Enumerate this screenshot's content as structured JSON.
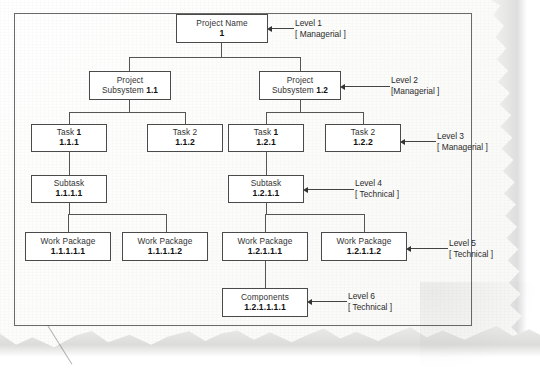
{
  "document": {
    "type": "work-breakdown-structure",
    "title": "Work Breakdown Structure Diagram",
    "medium": "scanned paper with torn right and bottom edges"
  },
  "nodes": [
    {
      "id": "n1",
      "title": "Project Name",
      "title_bold": "",
      "code": "1",
      "level": 1,
      "x": 176,
      "y": 14,
      "w": 92,
      "h": 29
    },
    {
      "id": "n2",
      "title": "Project",
      "title_bold": "",
      "code": "",
      "level": 2,
      "x": 89,
      "y": 71,
      "w": 82,
      "h": 29
    },
    {
      "id": "n3",
      "title": "Project",
      "title_bold": "",
      "code": "",
      "level": 2,
      "x": 259,
      "y": 71,
      "w": 82,
      "h": 29
    },
    {
      "id": "n4",
      "title": "Task 1",
      "title_bold": "1",
      "code": "1.1.1",
      "level": 3,
      "x": 31,
      "y": 124,
      "w": 76,
      "h": 28
    },
    {
      "id": "n5",
      "title": "Task 2",
      "title_bold": "",
      "code": "1.1.2",
      "level": 3,
      "x": 147,
      "y": 124,
      "w": 76,
      "h": 28
    },
    {
      "id": "n6",
      "title": "Task 1",
      "title_bold": "1",
      "code": "1.2.1",
      "level": 3,
      "x": 228,
      "y": 124,
      "w": 76,
      "h": 28
    },
    {
      "id": "n7",
      "title": "Task 2",
      "title_bold": "",
      "code": "1.2.2",
      "level": 3,
      "x": 325,
      "y": 124,
      "w": 76,
      "h": 28
    },
    {
      "id": "n8",
      "title": "Subtask",
      "title_bold": "",
      "code": "1.1.1.1",
      "level": 4,
      "x": 31,
      "y": 175,
      "w": 76,
      "h": 28
    },
    {
      "id": "n9",
      "title": "Subtask",
      "title_bold": "",
      "code": "1.2.1.1",
      "level": 4,
      "x": 228,
      "y": 175,
      "w": 76,
      "h": 28
    },
    {
      "id": "n10",
      "title": "Work Package",
      "title_bold": "",
      "code": "1.1.1.1.1",
      "level": 5,
      "x": 25,
      "y": 232,
      "w": 86,
      "h": 29
    },
    {
      "id": "n11",
      "title": "Work Package",
      "title_bold": "",
      "code": "1.1.1.1.2",
      "level": 5,
      "x": 122,
      "y": 232,
      "w": 86,
      "h": 29
    },
    {
      "id": "n12",
      "title": "Work Package",
      "title_bold": "",
      "code": "1.2.1.1.1",
      "level": 5,
      "x": 222,
      "y": 232,
      "w": 86,
      "h": 29
    },
    {
      "id": "n13",
      "title": "Work Package",
      "title_bold": "",
      "code": "1.2.1.1.2",
      "level": 5,
      "x": 321,
      "y": 232,
      "w": 86,
      "h": 29
    },
    {
      "id": "n14",
      "title": "Components",
      "title_bold": "",
      "code": "1.2.1.1.1.1",
      "level": 6,
      "x": 222,
      "y": 288,
      "w": 86,
      "h": 29
    }
  ],
  "subsystem_labels": [
    {
      "id": "n2",
      "prefix": "Subsystem ",
      "code": "1.1"
    },
    {
      "id": "n3",
      "prefix": "Subsystem ",
      "code": "1.2"
    }
  ],
  "annotations": [
    {
      "id": "a1",
      "level": "Level 1",
      "kind": "[ Managerial ]",
      "text_x": 295,
      "text_y": 18,
      "arrow_x": 272,
      "arrow_y": 28,
      "arrow_w": 22
    },
    {
      "id": "a2",
      "level": "Level 2",
      "kind": "[Managerial ]",
      "text_x": 391,
      "text_y": 75,
      "arrow_x": 345,
      "arrow_y": 86,
      "arrow_w": 45
    },
    {
      "id": "a3",
      "level": "Level 3",
      "kind": "[ Managerial ]",
      "text_x": 437,
      "text_y": 131,
      "arrow_x": 405,
      "arrow_y": 141,
      "arrow_w": 31
    },
    {
      "id": "a4",
      "level": "Level 4",
      "kind": "[ Technical ]",
      "text_x": 355,
      "text_y": 178,
      "arrow_x": 308,
      "arrow_y": 189,
      "arrow_w": 46
    },
    {
      "id": "a5",
      "level": "Level 5",
      "kind": "[ Technical ]",
      "text_x": 449,
      "text_y": 238,
      "arrow_x": 411,
      "arrow_y": 248,
      "arrow_w": 37
    },
    {
      "id": "a6",
      "level": "Level 6",
      "kind": "[ Technical ]",
      "text_x": 348,
      "text_y": 291,
      "arrow_x": 312,
      "arrow_y": 301,
      "arrow_w": 35
    }
  ],
  "connectors": {
    "description": "orthogonal parent-child lines",
    "segments": [
      {
        "o": "v",
        "x": 221,
        "y": 43,
        "len": 14
      },
      {
        "o": "h",
        "x": 129,
        "y": 57,
        "len": 172
      },
      {
        "o": "v",
        "x": 129,
        "y": 57,
        "len": 14
      },
      {
        "o": "v",
        "x": 300,
        "y": 57,
        "len": 14
      },
      {
        "o": "v",
        "x": 129,
        "y": 100,
        "len": 12
      },
      {
        "o": "h",
        "x": 69,
        "y": 112,
        "len": 117
      },
      {
        "o": "v",
        "x": 69,
        "y": 112,
        "len": 12
      },
      {
        "o": "v",
        "x": 185,
        "y": 112,
        "len": 12
      },
      {
        "o": "v",
        "x": 300,
        "y": 100,
        "len": 12
      },
      {
        "o": "h",
        "x": 266,
        "y": 112,
        "len": 97
      },
      {
        "o": "v",
        "x": 266,
        "y": 112,
        "len": 12
      },
      {
        "o": "v",
        "x": 363,
        "y": 112,
        "len": 12
      },
      {
        "o": "v",
        "x": 69,
        "y": 152,
        "len": 23
      },
      {
        "o": "v",
        "x": 266,
        "y": 152,
        "len": 23
      },
      {
        "o": "v",
        "x": 69,
        "y": 203,
        "len": 11
      },
      {
        "o": "h",
        "x": 68,
        "y": 214,
        "len": 98
      },
      {
        "o": "v",
        "x": 166,
        "y": 214,
        "len": 18
      },
      {
        "o": "v",
        "x": 68,
        "y": 214,
        "len": 18
      },
      {
        "o": "v",
        "x": 266,
        "y": 203,
        "len": 11
      },
      {
        "o": "h",
        "x": 265,
        "y": 214,
        "len": 99
      },
      {
        "o": "v",
        "x": 364,
        "y": 214,
        "len": 18
      },
      {
        "o": "v",
        "x": 265,
        "y": 214,
        "len": 18
      },
      {
        "o": "v",
        "x": 265,
        "y": 261,
        "len": 27
      }
    ]
  },
  "colors": {
    "paper": "#fdfdfc",
    "ink": "#1d1d1d",
    "line": "#555555",
    "frame": "#6a6a6a",
    "torn_shadow": "#dedede"
  }
}
